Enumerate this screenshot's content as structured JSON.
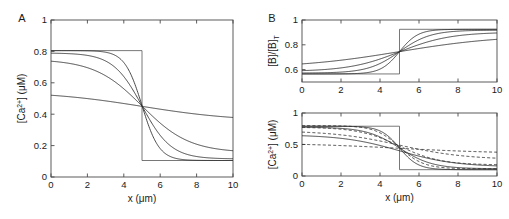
{
  "figure": {
    "background": "#ffffff",
    "line_color": "#2b2b2b",
    "axis_color": "#4a4a4a"
  },
  "panels": [
    {
      "id": "A",
      "label": "A",
      "label_x": 22,
      "label_y": 22,
      "box": {
        "x": 51,
        "y": 20,
        "w": 182,
        "h": 157
      },
      "xlabel": "x (μm)",
      "ylabel_parts": {
        "pre": "[Ca",
        "sup": "2+",
        "post": "] (μM)"
      },
      "xticks": [
        0,
        2,
        4,
        6,
        8,
        10
      ],
      "xticklabels": [
        "0",
        "2",
        "4",
        "6",
        "8",
        "10"
      ],
      "yticks": [
        0,
        0.2,
        0.4,
        0.6,
        0.8,
        1
      ],
      "yticklabels": [
        "0",
        "0.2",
        "0.4",
        "0.6",
        "0.8",
        "1"
      ],
      "xlim": [
        0,
        10
      ],
      "ylim": [
        0,
        1
      ],
      "chart_data": {
        "type": "line",
        "title": "",
        "xlabel": "x (μm)",
        "ylabel": "[Ca2+] (μM)",
        "xlim": [
          0,
          10
        ],
        "ylim": [
          0,
          1
        ],
        "grid": false,
        "legend": "none",
        "crossing_point": {
          "x": 5.0,
          "y": 0.45
        },
        "series": [
          {
            "name": "step",
            "style": "solid",
            "type": "step",
            "x": [
              0,
              5,
              5,
              10
            ],
            "y": [
              0.805,
              0.805,
              0.105,
              0.105
            ]
          },
          {
            "name": "sigmoid-steep",
            "style": "solid",
            "type": "tanh",
            "left": 0.805,
            "right": 0.105,
            "center": 5.0,
            "width": 0.95
          },
          {
            "name": "sigmoid-mid",
            "style": "solid",
            "type": "tanh",
            "left": 0.79,
            "right": 0.115,
            "center": 5.0,
            "width": 1.6
          },
          {
            "name": "sigmoid-broad",
            "style": "solid",
            "type": "tanh",
            "left": 0.75,
            "right": 0.155,
            "center": 5.0,
            "width": 2.6
          },
          {
            "name": "sigmoid-flat",
            "style": "solid",
            "type": "tanh",
            "left": 0.545,
            "right": 0.355,
            "center": 5.0,
            "width": 5.2
          }
        ]
      }
    },
    {
      "id": "B-top",
      "label": "B",
      "label_x": 272,
      "label_y": 22,
      "box": {
        "x": 302,
        "y": 20,
        "w": 195,
        "h": 62
      },
      "xlabel": "",
      "ylabel_parts": {
        "pre": "[B]/[B]",
        "sup": "",
        "post": "",
        "sub": "T"
      },
      "xticks": [
        0,
        2,
        4,
        6,
        8,
        10
      ],
      "xticklabels": [
        "0",
        "2",
        "4",
        "6",
        "8",
        "10"
      ],
      "yticks": [
        0.6,
        0.8,
        1
      ],
      "yticklabels": [
        "0.6",
        "0.8",
        "1"
      ],
      "xlim": [
        0,
        10
      ],
      "ylim": [
        0.5,
        1
      ],
      "chart_data": {
        "type": "line",
        "title": "",
        "xlabel": "",
        "ylabel": "[B]/[B]T",
        "xlim": [
          0,
          10
        ],
        "ylim": [
          0.5,
          1
        ],
        "grid": false,
        "legend": "none",
        "crossing_point": {
          "x": 5.0,
          "y": 0.745
        },
        "series": [
          {
            "name": "step",
            "style": "solid",
            "type": "step",
            "x": [
              0,
              5,
              5,
              10
            ],
            "y": [
              0.565,
              0.565,
              0.925,
              0.925
            ]
          },
          {
            "name": "sigmoid-steep",
            "style": "solid",
            "type": "tanh",
            "left": 0.565,
            "right": 0.925,
            "center": 5.0,
            "width": 0.95
          },
          {
            "name": "sigmoid-mid",
            "style": "solid",
            "type": "tanh",
            "left": 0.572,
            "right": 0.918,
            "center": 5.0,
            "width": 1.6
          },
          {
            "name": "sigmoid-broad",
            "style": "solid",
            "type": "tanh",
            "left": 0.585,
            "right": 0.902,
            "center": 5.0,
            "width": 2.6
          },
          {
            "name": "sigmoid-flat",
            "style": "solid",
            "type": "tanh",
            "left": 0.612,
            "right": 0.878,
            "center": 5.0,
            "width": 5.2
          }
        ]
      }
    },
    {
      "id": "B-bottom",
      "label": "",
      "label_x": 0,
      "label_y": 0,
      "box": {
        "x": 302,
        "y": 113,
        "w": 195,
        "h": 63
      },
      "xlabel": "x (μm)",
      "ylabel_parts": {
        "pre": "[Ca",
        "sup": "2+",
        "post": "] (μM)"
      },
      "xticks": [
        0,
        2,
        4,
        6,
        8,
        10
      ],
      "xticklabels": [
        "0",
        "2",
        "4",
        "6",
        "8",
        "10"
      ],
      "yticks": [
        0,
        0.5,
        1
      ],
      "yticklabels": [
        "0",
        "0.5",
        "1"
      ],
      "xlim": [
        0,
        10
      ],
      "ylim": [
        0,
        1
      ],
      "chart_data": {
        "type": "line",
        "title": "",
        "xlabel": "x (μm)",
        "ylabel": "[Ca2+] (μM)",
        "xlim": [
          0,
          10
        ],
        "ylim": [
          0,
          1
        ],
        "grid": false,
        "legend": "none",
        "crossing_point": {
          "x": 5.0,
          "y": 0.4
        },
        "series": [
          {
            "name": "step",
            "style": "solid",
            "type": "step",
            "x": [
              0,
              5,
              5,
              10
            ],
            "y": [
              0.79,
              0.79,
              0.1,
              0.1
            ]
          },
          {
            "name": "solid-steep",
            "style": "solid",
            "type": "tanh",
            "left": 0.79,
            "right": 0.1,
            "center": 5.0,
            "width": 0.95
          },
          {
            "name": "solid-mid",
            "style": "solid",
            "type": "tanh",
            "left": 0.775,
            "right": 0.115,
            "center": 5.0,
            "width": 1.7
          },
          {
            "name": "solid-broad",
            "style": "solid",
            "type": "tanh",
            "left": 0.655,
            "right": 0.145,
            "center": 5.0,
            "width": 2.9
          },
          {
            "name": "dashed-steep",
            "style": "dashed",
            "type": "tanh",
            "left": 0.8,
            "right": 0.115,
            "center": 5.0,
            "width": 1.25
          },
          {
            "name": "dashed-mid",
            "style": "dashed",
            "type": "tanh",
            "left": 0.775,
            "right": 0.175,
            "center": 5.0,
            "width": 2.1
          },
          {
            "name": "dashed-broad",
            "style": "dashed",
            "type": "tanh",
            "left": 0.72,
            "right": 0.26,
            "center": 5.0,
            "width": 3.4
          },
          {
            "name": "dashed-flat",
            "style": "dashed",
            "type": "tanh",
            "left": 0.525,
            "right": 0.355,
            "center": 5.0,
            "width": 5.4
          }
        ]
      }
    }
  ]
}
